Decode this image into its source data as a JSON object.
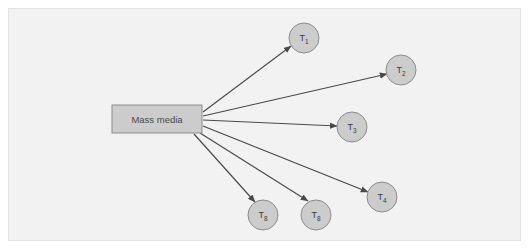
{
  "figure": {
    "kind": "radial-flow-diagram",
    "background_color": "#f2f2f2",
    "plate_border_color": "#e3e3e3",
    "page_color": "#ffffff"
  },
  "source": {
    "label": "Mass media",
    "shape": "rectangle",
    "fill_color": "#cccccc",
    "stroke_color": "#8c8c8c",
    "text_color": "#4a4a4a",
    "x": 112,
    "y": 105,
    "width": 90,
    "height": 28
  },
  "nodes": [
    {
      "base": "T",
      "subscript": "1",
      "cx": 304,
      "cy": 38,
      "r": 15
    },
    {
      "base": "T",
      "subscript": "2",
      "cx": 401,
      "cy": 70,
      "r": 15
    },
    {
      "base": "T",
      "subscript": "3",
      "cx": 352,
      "cy": 127,
      "r": 15
    },
    {
      "base": "T",
      "subscript": "4",
      "cx": 382,
      "cy": 197,
      "r": 15
    },
    {
      "base": "T",
      "subscript": "8",
      "cx": 316,
      "cy": 215,
      "r": 15
    },
    {
      "base": "T",
      "subscript": "8",
      "cx": 263,
      "cy": 215,
      "r": 15
    }
  ],
  "node_style": {
    "fill_color": "#cccccc",
    "stroke_color": "#8c8c8c",
    "text_color": "#3a3a3a"
  },
  "edges": [
    {
      "from": "Mass media",
      "to": "T1",
      "x1": 203,
      "y1": 112,
      "x2": 291,
      "y2": 46
    },
    {
      "from": "Mass media",
      "to": "T2",
      "x1": 203,
      "y1": 116,
      "x2": 387,
      "y2": 74
    },
    {
      "from": "Mass media",
      "to": "T3",
      "x1": 203,
      "y1": 120,
      "x2": 337,
      "y2": 126
    },
    {
      "from": "Mass media",
      "to": "T4",
      "x1": 203,
      "y1": 126,
      "x2": 368,
      "y2": 192
    },
    {
      "from": "Mass media",
      "to": "T8b",
      "x1": 200,
      "y1": 133,
      "x2": 308,
      "y2": 201
    },
    {
      "from": "Mass media",
      "to": "T8a",
      "x1": 194,
      "y1": 134,
      "x2": 255,
      "y2": 202
    }
  ],
  "edge_style": {
    "stroke_color": "#4a4a4a",
    "stroke_width": 1.2,
    "arrowhead": "solid-triangle"
  }
}
